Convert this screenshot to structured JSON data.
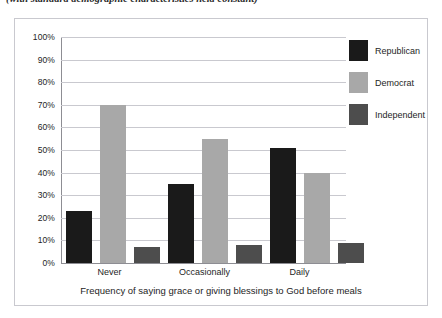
{
  "figure": {
    "caption": "(with standard demographic characteristics held constant)"
  },
  "chart_data": {
    "type": "bar",
    "title": "",
    "subtitle": "(with standard demographic characteristics held constant)",
    "xlabel": "Frequency of saying grace or giving blessings to God before meals",
    "ylabel": "",
    "categories": [
      "Never",
      "Occasionally",
      "Daily"
    ],
    "series": [
      {
        "name": "Republican",
        "color": "#1a1a1a",
        "values": [
          23,
          35,
          51
        ]
      },
      {
        "name": "Democrat",
        "color": "#a8a8a8",
        "values": [
          70,
          55,
          40
        ]
      },
      {
        "name": "Independent",
        "color": "#4d4d4d",
        "values": [
          7,
          8,
          9
        ]
      }
    ],
    "ylim": [
      0,
      100
    ],
    "ytick_step": 10,
    "ytick_labels": [
      "100%",
      "90%",
      "80%",
      "70%",
      "60%",
      "50%",
      "40%",
      "30%",
      "20%",
      "10%",
      "0%"
    ],
    "ytick_values": [
      100,
      90,
      80,
      70,
      60,
      50,
      40,
      30,
      20,
      10,
      0
    ],
    "grid": true,
    "legend_position": "right",
    "value_suffix": "%"
  }
}
